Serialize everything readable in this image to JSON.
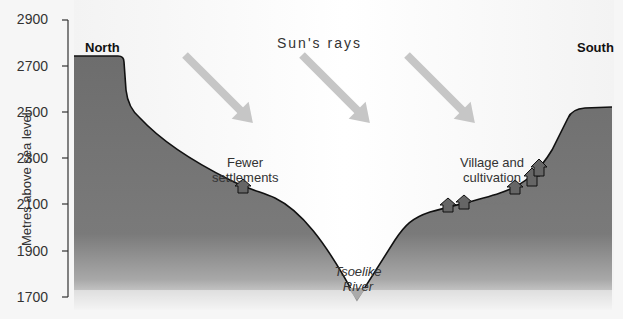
{
  "diagram": {
    "type": "cross-section",
    "y_axis": {
      "title": "Metres above sea level",
      "ticks": [
        "2900",
        "2700",
        "2500",
        "2300",
        "2100",
        "1900",
        "1700"
      ],
      "range": [
        1700,
        2900
      ]
    },
    "labels": {
      "north": "North",
      "south": "South",
      "sun_rays": "Sun's rays",
      "fewer_settlements_line1": "Fewer",
      "fewer_settlements_line2": "settlements",
      "village_line1": "Village and",
      "village_line2": "cultivation",
      "river_line1": "Tsoelike",
      "river_line2": "River"
    },
    "arrows": {
      "count": 3,
      "label": "sun-ray-arrow",
      "direction": "down-right"
    },
    "houses": {
      "north_slope_count": 1,
      "south_slope_count": 5
    },
    "colors": {
      "terrain_top": "#6f6f6f",
      "terrain_bottom": "#f4f4f4",
      "outline": "#111111",
      "arrow": "#c4c4c4",
      "house": "#666666",
      "sky": "#ffffff",
      "background": "#f6f6f6"
    }
  }
}
